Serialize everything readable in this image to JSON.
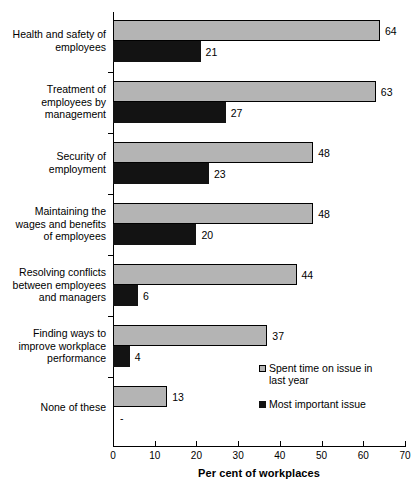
{
  "chart_data": {
    "type": "bar",
    "orientation": "horizontal",
    "title": "",
    "xlabel": "Per cent of workplaces",
    "ylabel": "",
    "xlim": [
      0,
      70
    ],
    "xticks": [
      0,
      10,
      20,
      30,
      40,
      50,
      60,
      70
    ],
    "grid": false,
    "legend_position": "bottom-right",
    "categories": [
      "Health and safety of employees",
      "Treatment of employees by management",
      "Security of employment",
      "Maintaining the wages and benefits of employees",
      "Resolving conflicts between employees and managers",
      "Finding ways to improve workplace performance",
      "None of these"
    ],
    "category_lines": [
      [
        "Health and safety of",
        "employees"
      ],
      [
        "Treatment of",
        "employees by",
        "management"
      ],
      [
        "Security of",
        "employment"
      ],
      [
        "Maintaining the",
        "wages and benefits",
        "of employees"
      ],
      [
        "Resolving conflicts",
        "between employees",
        "and managers"
      ],
      [
        "Finding ways to",
        "improve workplace",
        "performance"
      ],
      [
        "None of these"
      ]
    ],
    "series": [
      {
        "name": "Spent time on issue in last year",
        "color": "#b4b4b4",
        "values": [
          64,
          63,
          48,
          48,
          44,
          37,
          13
        ],
        "labels": [
          "64",
          "63",
          "48",
          "48",
          "44",
          "37",
          "13"
        ]
      },
      {
        "name": "Most important issue",
        "color": "#131313",
        "values": [
          21,
          27,
          23,
          20,
          6,
          4,
          0
        ],
        "labels": [
          "21",
          "27",
          "23",
          "20",
          "6",
          "4",
          "-"
        ]
      }
    ]
  },
  "legend": {
    "items": [
      {
        "label_lines": [
          "Spent time on issue in",
          "last year"
        ],
        "swatch": "gray-swatch-icon"
      },
      {
        "label_lines": [
          "Most important issue"
        ],
        "swatch": "black-swatch-icon"
      }
    ]
  }
}
